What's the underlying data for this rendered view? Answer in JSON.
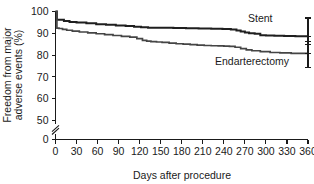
{
  "chart_data": {
    "type": "line",
    "title": "",
    "subtitle": "",
    "xlabel": "Days after procedure",
    "ylabel": "Freedom from major adverse events (%)",
    "ylabel_line1": "Freedom from major",
    "ylabel_line2": "adverse events (%)",
    "xlim": [
      0,
      360
    ],
    "ylim": [
      0,
      100
    ],
    "y_axis_break": true,
    "y_axis_break_between": [
      0,
      50
    ],
    "grid": false,
    "legend_position": "inline-right",
    "xticks": [
      0,
      30,
      60,
      90,
      120,
      150,
      180,
      210,
      240,
      270,
      300,
      330,
      360
    ],
    "xtick_labels": [
      "0",
      "30",
      "60",
      "90",
      "120",
      "150",
      "180",
      "210",
      "240",
      "270",
      "300",
      "330",
      "360"
    ],
    "yticks": [
      0,
      50,
      60,
      70,
      80,
      90,
      100
    ],
    "ytick_labels": [
      "0",
      "50",
      "60",
      "70",
      "80",
      "90",
      "100"
    ],
    "series": [
      {
        "name": "Stent",
        "label": "Stent",
        "color": "#1f1f1f",
        "style": "step",
        "x": [
          0,
          2,
          6,
          12,
          20,
          30,
          44,
          58,
          72,
          86,
          100,
          112,
          122,
          132,
          150,
          168,
          186,
          204,
          222,
          238,
          250,
          258,
          264,
          270,
          276,
          284,
          292,
          300,
          312,
          326,
          342,
          360
        ],
        "values": [
          100,
          96.2,
          96.2,
          95.6,
          95.2,
          95.0,
          94.6,
          94.2,
          93.9,
          93.6,
          93.3,
          93.0,
          92.8,
          92.6,
          92.5,
          92.4,
          92.3,
          92.2,
          92.1,
          92.0,
          91.8,
          91.3,
          90.8,
          90.4,
          90.0,
          89.8,
          89.1,
          89.0,
          88.9,
          88.8,
          88.7,
          88.6
        ]
      },
      {
        "name": "Endarterectomy",
        "label": "Endarterectomy",
        "color": "#454545",
        "style": "step",
        "x": [
          0,
          2,
          5,
          10,
          16,
          24,
          34,
          46,
          58,
          70,
          82,
          94,
          106,
          116,
          124,
          130,
          136,
          144,
          152,
          162,
          172,
          182,
          192,
          202,
          212,
          222,
          232,
          240,
          248,
          256,
          264,
          272,
          280,
          292,
          306,
          320,
          336,
          360
        ],
        "values": [
          100,
          92.4,
          92.2,
          91.8,
          91.4,
          91.0,
          90.6,
          90.2,
          89.8,
          89.4,
          89.0,
          88.6,
          88.2,
          87.6,
          86.8,
          86.4,
          86.2,
          86.0,
          85.8,
          85.5,
          85.2,
          85.0,
          84.8,
          84.6,
          84.4,
          84.3,
          84.2,
          84.1,
          84.0,
          83.6,
          83.0,
          82.4,
          82.0,
          81.6,
          81.2,
          81.0,
          80.8,
          80.6
        ]
      }
    ],
    "error_bars": [
      {
        "series": "Stent",
        "x": 360,
        "value": 88.6,
        "lower": 85.0,
        "upper": 97.0
      },
      {
        "series": "Endarterectomy",
        "x": 360,
        "value": 80.6,
        "lower": 74.5,
        "upper": 86.2
      }
    ]
  }
}
